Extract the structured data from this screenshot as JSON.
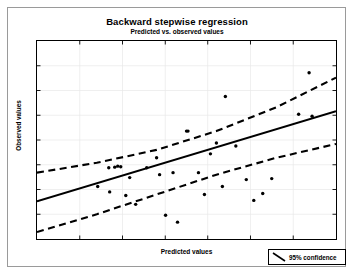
{
  "chart_data": {
    "type": "scatter",
    "title": "Backward stepwise regression",
    "subtitle": "Predicted vs. observed values",
    "xlabel": "Predicted values",
    "ylabel": "Observed values",
    "xlim": [
      0,
      100
    ],
    "ylim": [
      0,
      100
    ],
    "grid": true,
    "x_ticks": [
      0,
      14.3,
      28.6,
      42.9,
      57.1,
      71.4,
      85.7,
      100
    ],
    "y_ticks": [
      0,
      12.5,
      25,
      37.5,
      50,
      62.5,
      75,
      87.5,
      100
    ],
    "x_tick_labels": [],
    "y_tick_labels": [],
    "legend": {
      "position": "bottom-right-outside",
      "entries": [
        {
          "label": "95% confidence",
          "style": "dashed-line",
          "icon": "diagonal-line-icon"
        }
      ]
    },
    "series": [
      {
        "name": "Observed data points",
        "type": "scatter",
        "marker": "filled-circle",
        "color": "#000000",
        "points": [
          [
            20.3,
            26.5
          ],
          [
            24.0,
            36.0
          ],
          [
            24.3,
            23.8
          ],
          [
            26.0,
            36.3
          ],
          [
            27.0,
            36.8
          ],
          [
            28.0,
            36.5
          ],
          [
            29.7,
            22.0
          ],
          [
            31.0,
            31.0
          ],
          [
            33.0,
            17.5
          ],
          [
            36.7,
            36.0
          ],
          [
            40.0,
            41.0
          ],
          [
            41.0,
            32.5
          ],
          [
            43.0,
            12.0
          ],
          [
            45.5,
            33.5
          ],
          [
            47.0,
            8.5
          ],
          [
            50.0,
            54.5
          ],
          [
            50.5,
            54.5
          ],
          [
            54.0,
            33.5
          ],
          [
            56.0,
            22.5
          ],
          [
            58.0,
            43.0
          ],
          [
            60.0,
            48.5
          ],
          [
            62.0,
            26.5
          ],
          [
            63.0,
            72.0
          ],
          [
            66.5,
            47.0
          ],
          [
            70.0,
            30.0
          ],
          [
            72.5,
            19.5
          ],
          [
            75.5,
            23.0
          ],
          [
            78.5,
            30.5
          ],
          [
            87.5,
            63.0
          ],
          [
            91.0,
            84.0
          ],
          [
            92.0,
            62.0
          ]
        ]
      },
      {
        "name": "Regression line",
        "type": "line",
        "style": "solid",
        "color": "#000000",
        "x": [
          0,
          100
        ],
        "y": [
          19.0,
          64.5
        ]
      },
      {
        "name": "Upper 95% confidence band",
        "type": "line",
        "style": "dashed",
        "color": "#000000",
        "x": [
          0,
          20,
          40,
          60,
          80,
          100
        ],
        "y": [
          33.5,
          38.5,
          45.0,
          54.5,
          66.5,
          81.5
        ]
      },
      {
        "name": "Lower 95% confidence band",
        "type": "line",
        "style": "dashed",
        "color": "#000000",
        "x": [
          0,
          20,
          40,
          60,
          80,
          100
        ],
        "y": [
          3.5,
          12.5,
          22.5,
          32.5,
          41.0,
          48.0
        ]
      }
    ]
  }
}
